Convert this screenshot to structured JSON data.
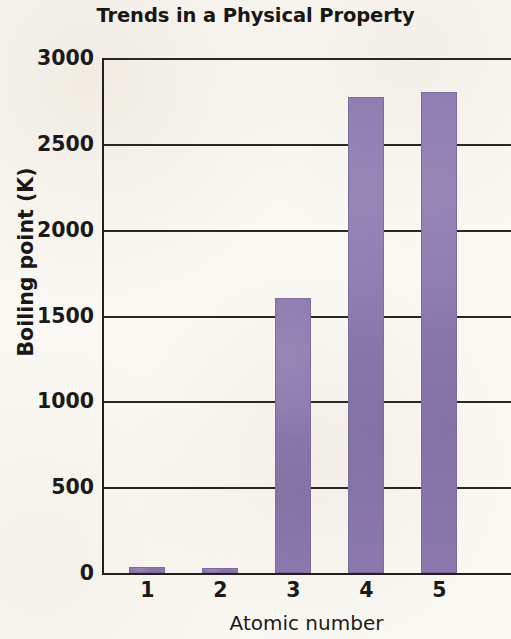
{
  "chart_data": {
    "type": "bar",
    "title": "Trends in a Physical Property",
    "xlabel": "Atomic number",
    "ylabel": "Boiling point (K)",
    "categories": [
      "1",
      "2",
      "3",
      "4",
      "5"
    ],
    "values": [
      35,
      30,
      1600,
      2770,
      2800
    ],
    "series": [
      {
        "name": "Boiling point",
        "values": [
          35,
          30,
          1600,
          2770,
          2800
        ]
      }
    ],
    "ylim": [
      0,
      3000
    ],
    "yticks": [
      0,
      500,
      1000,
      1500,
      2000,
      2500,
      3000
    ],
    "ytick_labels": [
      "0",
      "500",
      "1000",
      "1500",
      "2000",
      "2500",
      "3000"
    ],
    "grid": true,
    "legend": null,
    "legend_position": "none",
    "bar_color": "#8b79ae",
    "axis_color": "#241f1c",
    "background_color": "#faf8f3"
  }
}
